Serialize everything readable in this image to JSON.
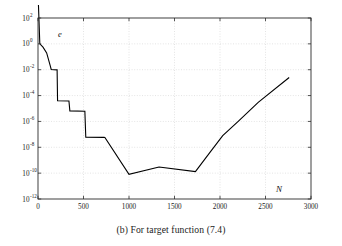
{
  "figure": {
    "caption": "(b) For target function (7.4)",
    "axis_label_y": "e",
    "axis_label_x": "N"
  },
  "chart_data": {
    "type": "line",
    "title": "",
    "xlabel": "N",
    "ylabel": "e",
    "yscale": "log",
    "xscale": "linear",
    "xlim": [
      0,
      3000
    ],
    "ylim": [
      1e-12,
      100
    ],
    "grid": true,
    "legend": null,
    "xticks": [
      0,
      500,
      1000,
      1500,
      2000,
      2500,
      3000
    ],
    "xtick_labels": [
      "0",
      "500",
      "1000",
      "1500",
      "2000",
      "2500",
      "3000"
    ],
    "yticks": [
      100,
      1,
      0.01,
      0.0001,
      1e-06,
      1e-08,
      1e-10,
      1e-12
    ],
    "ytick_labels": [
      "10^2",
      "10^0",
      "10^-2",
      "10^-4",
      "10^-6",
      "10^-8",
      "10^-10",
      "10^-12"
    ],
    "ytick_bases": [
      "10",
      "10",
      "10",
      "10",
      "10",
      "10",
      "10",
      "10"
    ],
    "ytick_exponents": [
      "2",
      "0",
      "-2",
      "-4",
      "-6",
      "-8",
      "-10",
      "-12"
    ],
    "line_color": "#000000",
    "line_width": 1.1,
    "series": [
      {
        "name": "error",
        "x": [
          5,
          20,
          55,
          95,
          135,
          145,
          210,
          215,
          340,
          350,
          515,
          525,
          725,
          735,
          1000,
          1330,
          1730,
          1900,
          2030,
          2200,
          2420,
          2760
        ],
        "y": [
          1000.0,
          1.0,
          0.55,
          0.2,
          0.02,
          0.0105,
          0.0098,
          4e-05,
          3.8e-05,
          6.5e-06,
          6.2e-06,
          6e-08,
          5.8e-08,
          5.7e-08,
          8e-11,
          3e-10,
          1.3e-10,
          5e-09,
          8e-08,
          1e-06,
          3e-05,
          0.0025
        ]
      }
    ],
    "annotations": [
      {
        "text": "e",
        "x_px": 58,
        "y_px": 34,
        "italic": true
      },
      {
        "text": "N",
        "x_px": 280,
        "y_px": 190,
        "italic": true
      }
    ]
  },
  "axes_box": {
    "left_px": 38,
    "right_px": 311,
    "top_px": 18,
    "bottom_px": 199
  }
}
